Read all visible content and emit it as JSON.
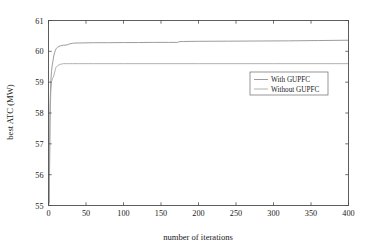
{
  "chart_data": {
    "type": "line",
    "title": "",
    "xlabel": "number of iterations",
    "ylabel": "best ATC (MW)",
    "xlim": [
      0,
      400
    ],
    "ylim": [
      55,
      61
    ],
    "xticks": [
      0,
      50,
      100,
      150,
      200,
      250,
      300,
      350,
      400
    ],
    "yticks": [
      55,
      56,
      57,
      58,
      59,
      60,
      61
    ],
    "xticklabels": [
      "0",
      "50",
      "100",
      "150",
      "200",
      "250",
      "300",
      "350",
      "400"
    ],
    "yticklabels": [
      "55",
      "56",
      "57",
      "58",
      "59",
      "60",
      "61"
    ],
    "grid": false,
    "legend_position": "center-right",
    "series": [
      {
        "name": "With GUPFC",
        "color": "#8a8a8a",
        "x": [
          1,
          2,
          3,
          4,
          5,
          6,
          7,
          8,
          9,
          10,
          12,
          14,
          16,
          18,
          20,
          22,
          25,
          28,
          32,
          36,
          40,
          50,
          60,
          80,
          100,
          120,
          140,
          160,
          172,
          175,
          180,
          200,
          240,
          280,
          320,
          360,
          400
        ],
        "y": [
          55.1,
          58.2,
          59.0,
          59.35,
          59.55,
          59.7,
          59.85,
          59.95,
          60.02,
          60.08,
          60.13,
          60.16,
          60.18,
          60.19,
          60.2,
          60.2,
          60.21,
          60.24,
          60.26,
          60.27,
          60.27,
          60.275,
          60.28,
          60.28,
          60.285,
          60.285,
          60.29,
          60.29,
          60.29,
          60.315,
          60.32,
          60.325,
          60.33,
          60.335,
          60.34,
          60.35,
          60.36
        ]
      },
      {
        "name": "Without GUPFC",
        "color": "#a3a3a3",
        "x": [
          1,
          2,
          3,
          4,
          5,
          6,
          7,
          8,
          9,
          10,
          12,
          14,
          16,
          18,
          20,
          24,
          28,
          32,
          40,
          60,
          100,
          150,
          200,
          250,
          300,
          350,
          400
        ],
        "y": [
          55.05,
          57.6,
          58.65,
          59.0,
          59.1,
          59.15,
          59.2,
          59.3,
          59.4,
          59.48,
          59.53,
          59.56,
          59.58,
          59.59,
          59.6,
          59.6,
          59.6,
          59.6,
          59.6,
          59.6,
          59.6,
          59.6,
          59.6,
          59.6,
          59.6,
          59.6,
          59.6
        ]
      }
    ]
  },
  "legend": {
    "items": [
      {
        "label": "With GUPFC"
      },
      {
        "label": "Without GUPFC"
      }
    ]
  }
}
